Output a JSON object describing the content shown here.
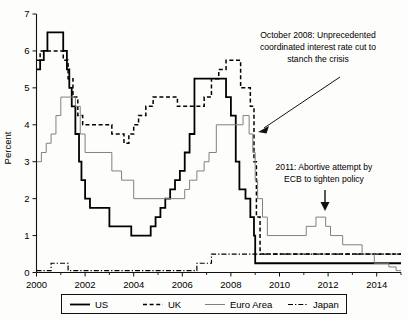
{
  "figure": {
    "ylabel": "Percent",
    "xlabel": "",
    "title": ""
  },
  "annotations": [
    {
      "name": "annotation-oct-2008",
      "lines": [
        "October 2008: Unprecedented",
        "coordinated interest rate cut to",
        "stanch the crisis"
      ],
      "arrow": "arrow-to-2008-crash"
    },
    {
      "name": "annotation-2011-ecb",
      "lines": [
        "2011: Abortive attempt by",
        "ECB to tighten policy"
      ],
      "arrow": "arrow-down-to-2011-bump"
    }
  ],
  "legend": {
    "items": [
      {
        "label": "US",
        "style": "solid",
        "color": "#000000"
      },
      {
        "label": "UK",
        "style": "dashed",
        "color": "#000000"
      },
      {
        "label": "Euro Area",
        "style": "solid-thin",
        "color": "#808080"
      },
      {
        "label": "Japan",
        "style": "dashdot",
        "color": "#000000"
      }
    ]
  },
  "chart_data": {
    "type": "line",
    "title": "",
    "xlabel": "",
    "ylabel": "Percent",
    "xlim": [
      2000.0,
      2015.0
    ],
    "ylim": [
      0,
      7
    ],
    "yticks": [
      0,
      1,
      2,
      3,
      4,
      5,
      6,
      7
    ],
    "xticks": [
      2000,
      2002,
      2004,
      2006,
      2008,
      2010,
      2012,
      2014
    ],
    "grid": false,
    "legend_position": "below-axes",
    "step_style": "post",
    "series": [
      {
        "name": "US",
        "style": "solid",
        "color": "#000000",
        "width": 1.8,
        "x": [
          2000.0,
          2000.15,
          2000.3,
          2000.45,
          2001.0,
          2001.1,
          2001.25,
          2001.35,
          2001.45,
          2001.6,
          2001.75,
          2001.85,
          2002.0,
          2002.2,
          2002.5,
          2002.9,
          2003.0,
          2003.5,
          2003.9,
          2004.5,
          2004.7,
          2004.9,
          2005.1,
          2005.3,
          2005.5,
          2005.7,
          2005.9,
          2006.1,
          2006.3,
          2006.5,
          2007.6,
          2007.8,
          2008.0,
          2008.2,
          2008.35,
          2008.6,
          2008.8,
          2008.95,
          2009.0,
          2015.0
        ],
        "y": [
          5.5,
          5.75,
          6.0,
          6.5,
          6.5,
          6.0,
          5.5,
          5.0,
          4.5,
          3.75,
          3.0,
          2.5,
          2.0,
          1.75,
          1.75,
          1.75,
          1.25,
          1.25,
          1.0,
          1.0,
          1.25,
          1.5,
          1.75,
          2.0,
          2.25,
          2.5,
          2.75,
          3.25,
          3.75,
          5.25,
          5.25,
          4.75,
          4.25,
          3.0,
          2.25,
          2.0,
          1.5,
          1.0,
          0.25,
          0.25
        ],
        "note": "Federal funds target rate, step series; peak 6.5 (2000-01), trough 1.0 (2003-04), peak 5.25 (2006-07), cut to 0.25 by end-2008"
      },
      {
        "name": "UK",
        "style": "dashed",
        "color": "#000000",
        "width": 1.5,
        "x": [
          2000.0,
          2000.15,
          2000.4,
          2001.1,
          2001.3,
          2001.5,
          2001.7,
          2001.9,
          2002.0,
          2002.4,
          2003.1,
          2003.6,
          2003.8,
          2004.0,
          2004.2,
          2004.5,
          2004.8,
          2005.4,
          2005.8,
          2006.6,
          2006.9,
          2007.2,
          2007.5,
          2007.8,
          2008.0,
          2008.4,
          2008.8,
          2008.95,
          2009.05,
          2009.2,
          2015.0
        ],
        "y": [
          5.75,
          6.0,
          6.0,
          5.75,
          5.25,
          4.75,
          4.25,
          4.0,
          4.0,
          4.0,
          3.75,
          3.5,
          3.75,
          4.0,
          4.25,
          4.5,
          4.75,
          4.75,
          4.5,
          4.5,
          4.75,
          5.25,
          5.5,
          5.75,
          5.75,
          5.0,
          4.5,
          3.0,
          1.5,
          0.5,
          0.5
        ],
        "note": "Bank of England Bank Rate; ~6 in 2000, trough ~3.5 in 2003, peak 5.75 in 2007-08, 0.5 from 2009"
      },
      {
        "name": "Euro Area",
        "style": "solid-thin",
        "color": "#808080",
        "width": 1.0,
        "x": [
          2000.0,
          2000.2,
          2000.4,
          2000.6,
          2000.8,
          2001.0,
          2001.4,
          2001.6,
          2001.8,
          2002.0,
          2002.9,
          2003.1,
          2003.5,
          2004.0,
          2005.9,
          2006.1,
          2006.3,
          2006.6,
          2006.9,
          2007.1,
          2007.4,
          2008.5,
          2008.75,
          2008.9,
          2009.0,
          2009.1,
          2009.3,
          2009.5,
          2011.1,
          2011.5,
          2011.9,
          2012.1,
          2012.6,
          2013.4,
          2013.9,
          2014.5,
          2014.8,
          2015.0
        ],
        "y": [
          3.0,
          3.25,
          3.5,
          3.75,
          4.25,
          4.75,
          4.75,
          4.5,
          3.75,
          3.25,
          3.25,
          2.75,
          2.5,
          2.0,
          2.0,
          2.25,
          2.5,
          2.75,
          3.0,
          3.25,
          4.0,
          4.25,
          3.75,
          3.25,
          2.5,
          2.0,
          1.5,
          1.0,
          1.25,
          1.5,
          1.25,
          1.0,
          0.75,
          0.5,
          0.25,
          0.15,
          0.05,
          0.05
        ],
        "note": "ECB main refinancing rate; peak 4.75 (2000-01), trough 2.0 (2003-05), peak 4.25 (2008), 2011 bump to 1.5, near zero by 2014"
      },
      {
        "name": "Japan",
        "style": "dashdot",
        "color": "#000000",
        "width": 1.2,
        "x": [
          2000.0,
          2000.6,
          2001.1,
          2001.3,
          2006.6,
          2007.2,
          2015.0
        ],
        "y": [
          0.05,
          0.25,
          0.25,
          0.05,
          0.25,
          0.5,
          0.5
        ],
        "note": "Bank of Japan policy rate; near zero throughout, brief 0.25 in 2000-01, 0.5 from 2007"
      }
    ]
  }
}
